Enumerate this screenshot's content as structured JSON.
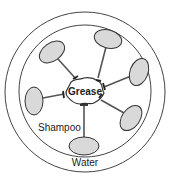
{
  "diagram": {
    "type": "micelle-cleaning-diagram",
    "center_label": "Grease",
    "shampoo_label": "Shampoo",
    "water_label": "Water",
    "colors": {
      "stroke": "#333333",
      "head_fill": "#d9d9d9",
      "background": "#ffffff"
    },
    "outer_circle": {
      "cx": 85,
      "cy": 92,
      "r": 80
    },
    "inner_circle": {
      "cx": 85,
      "cy": 91,
      "r": 66
    },
    "grease": {
      "cx": 84,
      "cy": 90
    },
    "molecules": [
      {
        "name": "top-left",
        "head": [
          52,
          52
        ],
        "rx": 14,
        "ry": 9,
        "angle": -35,
        "tail_end": [
          76,
          79
        ]
      },
      {
        "name": "top-right",
        "head": [
          108,
          39
        ],
        "rx": 14,
        "ry": 9,
        "angle": 15,
        "tail_end": [
          98,
          78
        ]
      },
      {
        "name": "right",
        "head": [
          139,
          72
        ],
        "rx": 9,
        "ry": 14,
        "angle": 20,
        "tail_end": [
          104,
          87
        ]
      },
      {
        "name": "left",
        "head": [
          34,
          101
        ],
        "rx": 9,
        "ry": 14,
        "angle": 0,
        "tail_end": [
          64,
          94
        ]
      },
      {
        "name": "bottom-right",
        "head": [
          131,
          118
        ],
        "rx": 9,
        "ry": 14,
        "angle": 35,
        "tail_end": [
          101,
          100
        ]
      },
      {
        "name": "bottom",
        "head": [
          84,
          146
        ],
        "rx": 15,
        "ry": 9,
        "angle": 0,
        "tail_end": [
          84,
          106
        ]
      }
    ]
  }
}
